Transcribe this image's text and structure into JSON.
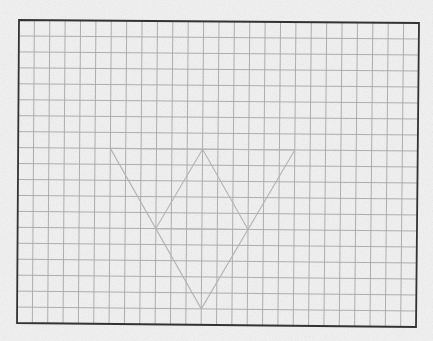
{
  "figure": {
    "background_color": "#efefef",
    "grid": {
      "columns": 26,
      "rows": 19,
      "line_color": "#a6a6a6",
      "line_width": 0.9
    },
    "frame": {
      "top_left": [
        19,
        20
      ],
      "top_right": [
        419,
        23
      ],
      "bottom_right": [
        416,
        327
      ],
      "bottom_left": [
        17,
        323
      ],
      "stroke_color": "#333333",
      "stroke_width": 1.8
    },
    "shape": {
      "stroke_color": "#b4b4b4",
      "stroke_width": 1.1,
      "vertices_grid": {
        "outer_top_left": [
          6,
          8
        ],
        "outer_top_right": [
          18,
          8
        ],
        "bottom": [
          12,
          18
        ],
        "inner_top": [
          12,
          8
        ],
        "inner_left": [
          9,
          13
        ],
        "inner_right": [
          15,
          13
        ]
      },
      "segments": [
        [
          "outer_top_left",
          "outer_top_right"
        ],
        [
          "outer_top_left",
          "bottom"
        ],
        [
          "outer_top_right",
          "bottom"
        ],
        [
          "inner_left",
          "inner_top"
        ],
        [
          "inner_top",
          "inner_right"
        ],
        [
          "inner_left",
          "inner_right"
        ]
      ]
    }
  }
}
